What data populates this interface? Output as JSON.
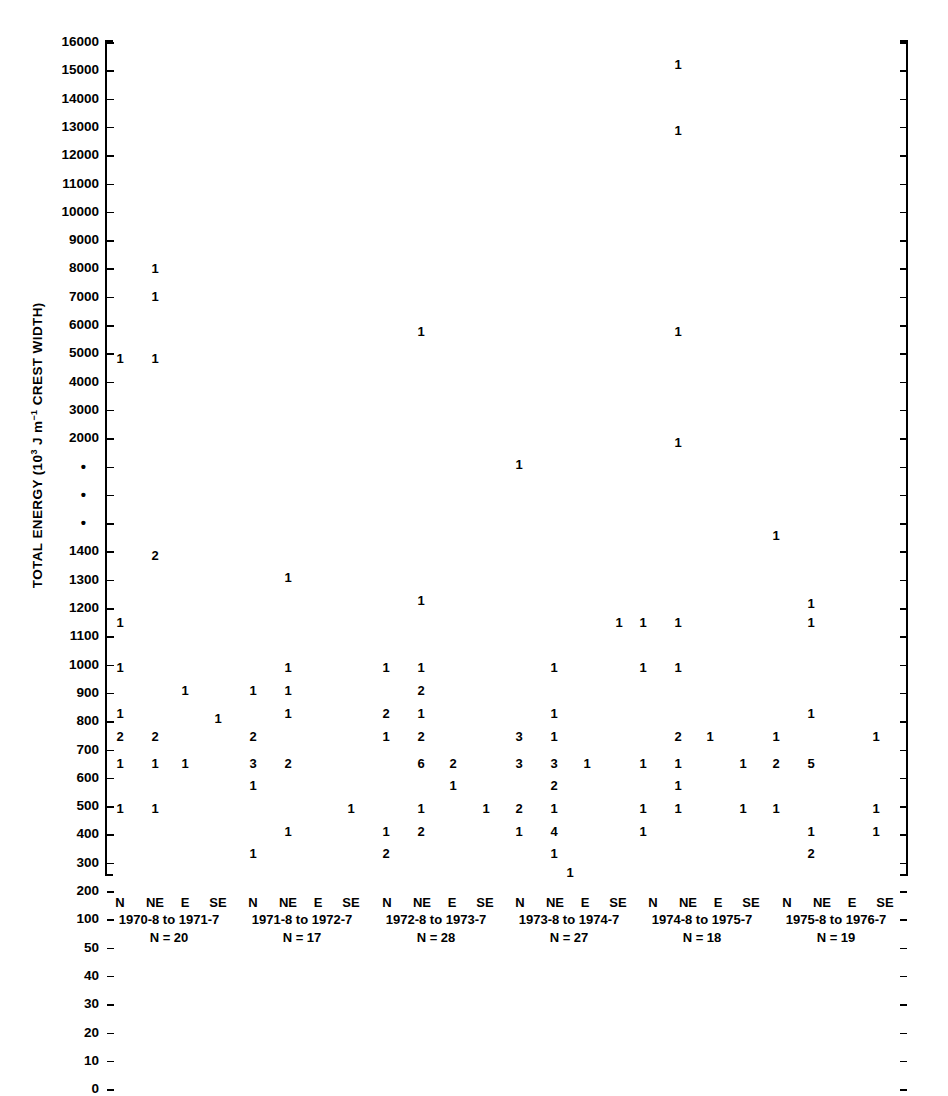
{
  "chart_data": {
    "type": "scatter",
    "title": "",
    "ylabel": "TOTAL ENERGY (10³ J m⁻¹ CREST WIDTH)",
    "ylabel_parts": {
      "pre": "TOTAL ENERGY (10",
      "sup": "3",
      "mid": " J m",
      "sup2": "−1",
      "post": " CREST WIDTH)"
    },
    "xlabel": "",
    "grid": false,
    "legend": "none",
    "axis_break": true,
    "axis_break_marker": "•",
    "y_ticks": [
      {
        "label": "16000",
        "y": 42
      },
      {
        "label": "15000",
        "y": 70
      },
      {
        "label": "14000",
        "y": 99
      },
      {
        "label": "13000",
        "y": 127
      },
      {
        "label": "12000",
        "y": 155
      },
      {
        "label": "11000",
        "y": 184
      },
      {
        "label": "10000",
        "y": 212
      },
      {
        "label": "9000",
        "y": 240
      },
      {
        "label": "8000",
        "y": 269
      },
      {
        "label": "7000",
        "y": 297
      },
      {
        "label": "6000",
        "y": 325
      },
      {
        "label": "5000",
        "y": 354
      },
      {
        "label": "4000",
        "y": 382
      },
      {
        "label": "3000",
        "y": 410
      },
      {
        "label": "2000",
        "y": 439
      },
      {
        "label": "•",
        "y": 467
      },
      {
        "label": "•",
        "y": 495
      },
      {
        "label": "•",
        "y": 524
      },
      {
        "label": "1400",
        "y": 552
      },
      {
        "label": "1300",
        "y": 580
      },
      {
        "label": "1200",
        "y": 609
      },
      {
        "label": "1100",
        "y": 637
      },
      {
        "label": "1000",
        "y": 665
      },
      {
        "label": "900",
        "y": 694
      },
      {
        "label": "800",
        "y": 722
      },
      {
        "label": "700",
        "y": 750
      },
      {
        "label": "600",
        "y": 779
      },
      {
        "label": "500",
        "y": 807
      },
      {
        "label": "400",
        "y": 835
      },
      {
        "label": "300",
        "y": 864
      },
      {
        "label": "200",
        "y": 892
      },
      {
        "label": "100",
        "y": 920
      },
      {
        "label": "50",
        "y": 949
      },
      {
        "label": "40",
        "y": 977
      },
      {
        "label": "30",
        "y": 1005
      },
      {
        "label": "20",
        "y": 1034
      },
      {
        "label": "10",
        "y": 1062
      },
      {
        "label": "0",
        "y": 1090
      }
    ],
    "directions": [
      "N",
      "NE",
      "E",
      "SE"
    ],
    "groups": [
      {
        "period": "1970-8 to 1971-7",
        "n_label": "N = 20",
        "n": 20,
        "center_x": 169
      },
      {
        "period": "1971-8 to 1972-7",
        "n_label": "N = 17",
        "n": 17,
        "center_x": 302
      },
      {
        "period": "1972-8 to 1973-7",
        "n_label": "N = 28",
        "n": 28,
        "center_x": 436
      },
      {
        "period": "1973-8 to 1974-7",
        "n_label": "N = 27",
        "n": 27,
        "center_x": 569
      },
      {
        "period": "1974-8 to 1975-7",
        "n_label": "N = 18",
        "n": 18,
        "center_x": 702
      },
      {
        "period": "1975-8 to 1976-7",
        "n_label": "N = 19",
        "n": 19,
        "center_x": 836
      }
    ],
    "points": [
      {
        "group": 0,
        "dir": "N",
        "energy": 2000,
        "count": "1",
        "x": 120,
        "y": 352
      },
      {
        "group": 0,
        "dir": "NE",
        "energy": 6000,
        "count": "1",
        "x": 155,
        "y": 262
      },
      {
        "group": 0,
        "dir": "NE",
        "energy": 5000,
        "count": "1",
        "x": 155,
        "y": 290
      },
      {
        "group": 0,
        "dir": "NE",
        "energy": 2000,
        "count": "1",
        "x": 155,
        "y": 352
      },
      {
        "group": 0,
        "dir": "NE",
        "energy": 900,
        "count": "2",
        "x": 155,
        "y": 549
      },
      {
        "group": 0,
        "dir": "N",
        "energy": 600,
        "count": "1",
        "x": 120,
        "y": 616
      },
      {
        "group": 0,
        "dir": "N",
        "energy": 400,
        "count": "1",
        "x": 120,
        "y": 661
      },
      {
        "group": 0,
        "dir": "E",
        "energy": 300,
        "count": "1",
        "x": 185,
        "y": 684
      },
      {
        "group": 0,
        "dir": "N",
        "energy": 200,
        "count": "1",
        "x": 120,
        "y": 707
      },
      {
        "group": 0,
        "dir": "SE",
        "energy": 200,
        "count": "1",
        "x": 218,
        "y": 712
      },
      {
        "group": 0,
        "dir": "N",
        "energy": 100,
        "count": "2",
        "x": 120,
        "y": 730
      },
      {
        "group": 0,
        "dir": "NE",
        "energy": 100,
        "count": "2",
        "x": 155,
        "y": 730
      },
      {
        "group": 0,
        "dir": "N",
        "energy": 50,
        "count": "1",
        "x": 120,
        "y": 757
      },
      {
        "group": 0,
        "dir": "NE",
        "energy": 50,
        "count": "1",
        "x": 155,
        "y": 757
      },
      {
        "group": 0,
        "dir": "E",
        "energy": 50,
        "count": "1",
        "x": 185,
        "y": 757
      },
      {
        "group": 0,
        "dir": "N",
        "energy": 30,
        "count": "1",
        "x": 120,
        "y": 802
      },
      {
        "group": 0,
        "dir": "NE",
        "energy": 30,
        "count": "1",
        "x": 155,
        "y": 802
      },
      {
        "group": 1,
        "dir": "NE",
        "energy": 800,
        "count": "1",
        "x": 288,
        "y": 571
      },
      {
        "group": 1,
        "dir": "NE",
        "energy": 400,
        "count": "1",
        "x": 288,
        "y": 661
      },
      {
        "group": 1,
        "dir": "N",
        "energy": 300,
        "count": "1",
        "x": 253,
        "y": 684
      },
      {
        "group": 1,
        "dir": "NE",
        "energy": 300,
        "count": "1",
        "x": 288,
        "y": 684
      },
      {
        "group": 1,
        "dir": "NE",
        "energy": 200,
        "count": "1",
        "x": 288,
        "y": 707
      },
      {
        "group": 1,
        "dir": "N",
        "energy": 100,
        "count": "2",
        "x": 253,
        "y": 730
      },
      {
        "group": 1,
        "dir": "N",
        "energy": 50,
        "count": "3",
        "x": 253,
        "y": 757
      },
      {
        "group": 1,
        "dir": "NE",
        "energy": 50,
        "count": "2",
        "x": 288,
        "y": 757
      },
      {
        "group": 1,
        "dir": "N",
        "energy": 40,
        "count": "1",
        "x": 253,
        "y": 779
      },
      {
        "group": 1,
        "dir": "SE",
        "energy": 30,
        "count": "1",
        "x": 351,
        "y": 802
      },
      {
        "group": 1,
        "dir": "NE",
        "energy": 20,
        "count": "1",
        "x": 288,
        "y": 825
      },
      {
        "group": 1,
        "dir": "N",
        "energy": 10,
        "count": "1",
        "x": 253,
        "y": 847
      },
      {
        "group": 2,
        "dir": "NE",
        "energy": 3000,
        "count": "1",
        "x": 421,
        "y": 325
      },
      {
        "group": 2,
        "dir": "NE",
        "energy": 700,
        "count": "1",
        "x": 421,
        "y": 594
      },
      {
        "group": 2,
        "dir": "N",
        "energy": 400,
        "count": "1",
        "x": 386,
        "y": 661
      },
      {
        "group": 2,
        "dir": "NE",
        "energy": 400,
        "count": "1",
        "x": 421,
        "y": 661
      },
      {
        "group": 2,
        "dir": "NE",
        "energy": 300,
        "count": "2",
        "x": 421,
        "y": 684
      },
      {
        "group": 2,
        "dir": "N",
        "energy": 200,
        "count": "2",
        "x": 386,
        "y": 707
      },
      {
        "group": 2,
        "dir": "NE",
        "energy": 200,
        "count": "1",
        "x": 421,
        "y": 707
      },
      {
        "group": 2,
        "dir": "N",
        "energy": 100,
        "count": "1",
        "x": 386,
        "y": 730
      },
      {
        "group": 2,
        "dir": "NE",
        "energy": 100,
        "count": "2",
        "x": 421,
        "y": 730
      },
      {
        "group": 2,
        "dir": "NE",
        "energy": 50,
        "count": "6",
        "x": 421,
        "y": 757
      },
      {
        "group": 2,
        "dir": "E",
        "energy": 50,
        "count": "2",
        "x": 453,
        "y": 757
      },
      {
        "group": 2,
        "dir": "E",
        "energy": 40,
        "count": "1",
        "x": 453,
        "y": 779
      },
      {
        "group": 2,
        "dir": "NE",
        "energy": 30,
        "count": "1",
        "x": 421,
        "y": 802
      },
      {
        "group": 2,
        "dir": "SE",
        "energy": 30,
        "count": "1",
        "x": 486,
        "y": 802
      },
      {
        "group": 2,
        "dir": "N",
        "energy": 20,
        "count": "1",
        "x": 386,
        "y": 825
      },
      {
        "group": 2,
        "dir": "NE",
        "energy": 20,
        "count": "2",
        "x": 421,
        "y": 825
      },
      {
        "group": 2,
        "dir": "N",
        "energy": 10,
        "count": "2",
        "x": 386,
        "y": 847
      },
      {
        "group": 3,
        "dir": "N",
        "energy": 1300,
        "count": "1",
        "x": 519,
        "y": 458
      },
      {
        "group": 3,
        "dir": "SE",
        "energy": 600,
        "count": "1",
        "x": 619,
        "y": 616
      },
      {
        "group": 3,
        "dir": "NE",
        "energy": 400,
        "count": "1",
        "x": 554,
        "y": 661
      },
      {
        "group": 3,
        "dir": "NE",
        "energy": 200,
        "count": "1",
        "x": 554,
        "y": 707
      },
      {
        "group": 3,
        "dir": "N",
        "energy": 100,
        "count": "3",
        "x": 519,
        "y": 730
      },
      {
        "group": 3,
        "dir": "NE",
        "energy": 100,
        "count": "1",
        "x": 554,
        "y": 730
      },
      {
        "group": 3,
        "dir": "N",
        "energy": 50,
        "count": "3",
        "x": 519,
        "y": 757
      },
      {
        "group": 3,
        "dir": "NE",
        "energy": 50,
        "count": "3",
        "x": 554,
        "y": 757
      },
      {
        "group": 3,
        "dir": "E",
        "energy": 50,
        "count": "1",
        "x": 587,
        "y": 757
      },
      {
        "group": 3,
        "dir": "NE",
        "energy": 40,
        "count": "2",
        "x": 554,
        "y": 779
      },
      {
        "group": 3,
        "dir": "N",
        "energy": 30,
        "count": "2",
        "x": 519,
        "y": 802
      },
      {
        "group": 3,
        "dir": "NE",
        "energy": 30,
        "count": "1",
        "x": 554,
        "y": 802
      },
      {
        "group": 3,
        "dir": "N",
        "energy": 20,
        "count": "1",
        "x": 519,
        "y": 825
      },
      {
        "group": 3,
        "dir": "NE",
        "energy": 20,
        "count": "4",
        "x": 554,
        "y": 825
      },
      {
        "group": 3,
        "dir": "NE",
        "energy": 10,
        "count": "1",
        "x": 554,
        "y": 847
      },
      {
        "group": 3,
        "dir": "E",
        "energy": 0,
        "count": "1",
        "x": 570,
        "y": 866
      },
      {
        "group": 4,
        "dir": "NE",
        "energy": 15000,
        "count": "1",
        "x": 678,
        "y": 58
      },
      {
        "group": 4,
        "dir": "NE",
        "energy": 12000,
        "count": "1",
        "x": 678,
        "y": 124
      },
      {
        "group": 4,
        "dir": "NE",
        "energy": 3000,
        "count": "1",
        "x": 678,
        "y": 325
      },
      {
        "group": 4,
        "dir": "NE",
        "energy": 1400,
        "count": "1",
        "x": 678,
        "y": 436
      },
      {
        "group": 4,
        "dir": "N",
        "energy": 600,
        "count": "1",
        "x": 643,
        "y": 616
      },
      {
        "group": 4,
        "dir": "NE",
        "energy": 600,
        "count": "1",
        "x": 678,
        "y": 616
      },
      {
        "group": 4,
        "dir": "N",
        "energy": 400,
        "count": "1",
        "x": 643,
        "y": 661
      },
      {
        "group": 4,
        "dir": "NE",
        "energy": 400,
        "count": "1",
        "x": 678,
        "y": 661
      },
      {
        "group": 4,
        "dir": "NE",
        "energy": 100,
        "count": "2",
        "x": 678,
        "y": 730
      },
      {
        "group": 4,
        "dir": "E",
        "energy": 100,
        "count": "1",
        "x": 710,
        "y": 730
      },
      {
        "group": 4,
        "dir": "N",
        "energy": 50,
        "count": "1",
        "x": 643,
        "y": 757
      },
      {
        "group": 4,
        "dir": "NE",
        "energy": 50,
        "count": "1",
        "x": 678,
        "y": 757
      },
      {
        "group": 4,
        "dir": "NE",
        "energy": 40,
        "count": "1",
        "x": 678,
        "y": 779
      },
      {
        "group": 4,
        "dir": "N",
        "energy": 30,
        "count": "1",
        "x": 643,
        "y": 802
      },
      {
        "group": 4,
        "dir": "NE",
        "energy": 30,
        "count": "1",
        "x": 678,
        "y": 802
      },
      {
        "group": 4,
        "dir": "SE",
        "energy": 30,
        "count": "1",
        "x": 743,
        "y": 802
      },
      {
        "group": 4,
        "dir": "N",
        "energy": 20,
        "count": "1",
        "x": 643,
        "y": 825
      },
      {
        "group": 4,
        "dir": "SE",
        "energy": 50,
        "count": "1",
        "x": 743,
        "y": 757
      },
      {
        "group": 5,
        "dir": "NE",
        "energy": 1200,
        "count": "1",
        "x": 811,
        "y": 597
      },
      {
        "group": 5,
        "dir": "N",
        "energy": 1000,
        "count": "1",
        "x": 776,
        "y": 529
      },
      {
        "group": 5,
        "dir": "NE",
        "energy": 600,
        "count": "1",
        "x": 811,
        "y": 616
      },
      {
        "group": 5,
        "dir": "NE",
        "energy": 200,
        "count": "1",
        "x": 811,
        "y": 707
      },
      {
        "group": 5,
        "dir": "N",
        "energy": 100,
        "count": "1",
        "x": 776,
        "y": 730
      },
      {
        "group": 5,
        "dir": "SE",
        "energy": 100,
        "count": "1",
        "x": 876,
        "y": 730
      },
      {
        "group": 5,
        "dir": "N",
        "energy": 50,
        "count": "2",
        "x": 776,
        "y": 757
      },
      {
        "group": 5,
        "dir": "NE",
        "energy": 50,
        "count": "5",
        "x": 811,
        "y": 757
      },
      {
        "group": 5,
        "dir": "N",
        "energy": 30,
        "count": "1",
        "x": 776,
        "y": 802
      },
      {
        "group": 5,
        "dir": "SE",
        "energy": 30,
        "count": "1",
        "x": 876,
        "y": 802
      },
      {
        "group": 5,
        "dir": "NE",
        "energy": 20,
        "count": "1",
        "x": 811,
        "y": 825
      },
      {
        "group": 5,
        "dir": "SE",
        "energy": 20,
        "count": "1",
        "x": 876,
        "y": 825
      },
      {
        "group": 5,
        "dir": "NE",
        "energy": 10,
        "count": "2",
        "x": 811,
        "y": 847
      }
    ]
  },
  "axis": {
    "left_x": 105,
    "right_x": 906,
    "top_y": 40,
    "bottom_y": 874,
    "tick_top": 42,
    "tick_step": 28.3
  },
  "colors": {
    "ink": "#000000",
    "background": "#ffffff"
  }
}
